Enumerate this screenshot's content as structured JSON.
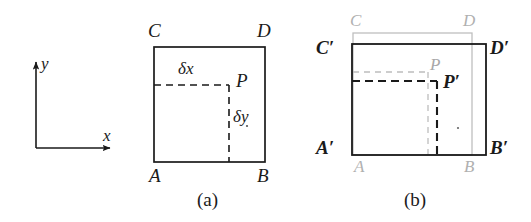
{
  "figure": {
    "background_color": "#ffffff",
    "line_color": "#1a1a1a",
    "ghost_color": "#b8b8b8"
  },
  "panel_a": {
    "caption": "(a)",
    "axes": {
      "x_label": "x",
      "y_label": "y"
    },
    "vertices": {
      "bottom_left": "A",
      "bottom_right": "B",
      "top_left": "C",
      "top_right": "D"
    },
    "point": "P",
    "dimensions": {
      "horizontal": "δx",
      "vertical": "δy"
    }
  },
  "panel_b": {
    "caption": "(b)",
    "original_vertices": {
      "bottom_left": "A",
      "bottom_right": "B",
      "top_left": "C",
      "top_right": "D"
    },
    "original_point": "P",
    "deformed_vertices": {
      "bottom_left": "A′",
      "bottom_right": "B′",
      "top_left": "C′",
      "top_right": "D′"
    },
    "deformed_point": "P′"
  }
}
